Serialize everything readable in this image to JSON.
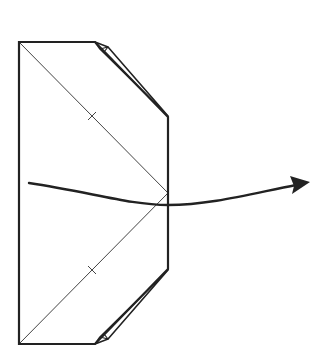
{
  "diagram": {
    "type": "origami-fold-step",
    "colors": {
      "background": "#ffffff",
      "outline": "#222222",
      "crease": "#444444",
      "arrow": "#222222"
    },
    "shape": {
      "outline_points": [
        [
          19,
          42
        ],
        [
          95,
          42
        ],
        [
          168,
          117
        ],
        [
          168,
          269
        ],
        [
          95,
          344
        ],
        [
          19,
          344
        ]
      ],
      "upper_flap": [
        [
          95,
          42
        ],
        [
          108,
          47
        ],
        [
          168,
          117
        ],
        [
          100,
          48
        ]
      ],
      "lower_flap": [
        [
          95,
          344
        ],
        [
          108,
          338
        ],
        [
          168,
          269
        ],
        [
          100,
          338
        ]
      ]
    },
    "creases": [
      {
        "from": [
          19,
          42
        ],
        "to": [
          168,
          193
        ],
        "tick_at": [
          92,
          116
        ]
      },
      {
        "from": [
          19,
          344
        ],
        "to": [
          168,
          193
        ],
        "tick_at": [
          92,
          270
        ]
      }
    ],
    "arrow": {
      "path": "M29,183 C90,192 130,205 168,205 C210,205 250,194 296,184",
      "head_tip": [
        308,
        182
      ]
    }
  }
}
